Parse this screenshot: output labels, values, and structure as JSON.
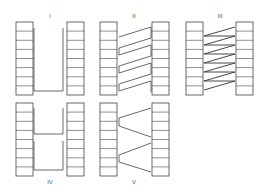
{
  "diagram": {
    "stroke_color": "#444444",
    "fill_color": "#ffffff",
    "cells_per_column": 8,
    "panels": [
      {
        "id": "I",
        "label": "I",
        "connection": "single U-shaped loop at bottom",
        "label_position": "top"
      },
      {
        "id": "II",
        "label": "II",
        "connection": "zigzag parallelogram strands (4 loops)",
        "label_position": "top"
      },
      {
        "id": "III",
        "label": "III",
        "connection": "dense zigzag diagonal strands (8)",
        "label_position": "top"
      },
      {
        "id": "IV",
        "label": "IV",
        "connection": "two stacked rectangular loops",
        "label_position": "bottom"
      },
      {
        "id": "V",
        "label": "V",
        "connection": "two triangular wedges (converging strands)",
        "label_position": "bottom"
      }
    ]
  }
}
